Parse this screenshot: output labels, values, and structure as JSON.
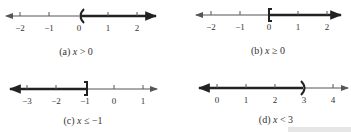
{
  "figures": [
    {
      "id": "a",
      "caption_prefix": "(a) ",
      "caption_var": "x",
      "caption_rest": " > 0",
      "ticks": [
        "−2",
        "−1",
        "0",
        "1",
        "2"
      ],
      "endpoint_value": "0",
      "endpoint_symbol": "(",
      "direction": "right"
    },
    {
      "id": "b",
      "caption_prefix": "(b) ",
      "caption_var": "x",
      "caption_rest": " ≥ 0",
      "ticks": [
        "−2",
        "−1",
        "0",
        "1",
        "2"
      ],
      "endpoint_value": "0",
      "endpoint_symbol": "[",
      "direction": "right"
    },
    {
      "id": "c",
      "caption_prefix": "(c) ",
      "caption_var": "x",
      "caption_rest": " ≤ −1",
      "ticks": [
        "−3",
        "−2",
        "−1",
        "0",
        "1"
      ],
      "endpoint_value": "−1",
      "endpoint_symbol": "]",
      "direction": "left"
    },
    {
      "id": "d",
      "caption_prefix": "(d) ",
      "caption_var": "x",
      "caption_rest": " < 3",
      "ticks": [
        "0",
        "1",
        "2",
        "3",
        "4"
      ],
      "endpoint_value": "3",
      "endpoint_symbol": ")",
      "direction": "left"
    }
  ],
  "colors": {
    "axis": "#555555",
    "shade": "#222222",
    "text": "#333333"
  }
}
